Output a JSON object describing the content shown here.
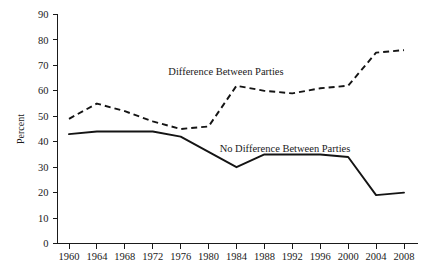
{
  "chart_data": {
    "type": "line",
    "title": "",
    "subtitle": "",
    "xlabel": "",
    "ylabel": "Percent",
    "x": [
      1960,
      1964,
      1968,
      1972,
      1976,
      1980,
      1984,
      1988,
      1992,
      1996,
      2000,
      2004,
      2008
    ],
    "categories": [
      "1960",
      "1964",
      "1968",
      "1972",
      "1976",
      "1980",
      "1984",
      "1988",
      "1992",
      "1996",
      "2000",
      "2004",
      "2008"
    ],
    "xlim": [
      1960,
      2008
    ],
    "ylim": [
      0,
      90
    ],
    "ytick_values": [
      0,
      10,
      20,
      30,
      40,
      50,
      60,
      70,
      80,
      90
    ],
    "ytick_labels": [
      "0",
      "10",
      "20",
      "30",
      "40",
      "50",
      "60",
      "70",
      "80",
      "90"
    ],
    "xtick_labels": [
      "1960",
      "1964",
      "1968",
      "1972",
      "1976",
      "1980",
      "1984",
      "1988",
      "1992",
      "1996",
      "2000",
      "2004",
      "2008"
    ],
    "grid": false,
    "legend_position": "inline-annotation",
    "series": [
      {
        "name": "Difference Between Parties",
        "style": "dashed",
        "color": "#141414",
        "values": [
          49,
          55,
          52,
          48,
          45,
          46,
          62,
          60,
          59,
          61,
          62,
          75,
          76
        ]
      },
      {
        "name": "No Difference Between Parties",
        "style": "solid",
        "color": "#141414",
        "values": [
          43,
          44,
          44,
          44,
          42,
          36,
          30,
          35,
          35,
          35,
          34,
          19,
          20
        ]
      }
    ],
    "annotations": [
      {
        "name": "difference-between-parties-label",
        "text": "Difference Between Parties",
        "x_px": 226,
        "y_px": 75
      },
      {
        "name": "no-difference-between-parties-label",
        "text": "No Difference Between Parties",
        "x_px": 285,
        "y_px": 152
      }
    ]
  }
}
